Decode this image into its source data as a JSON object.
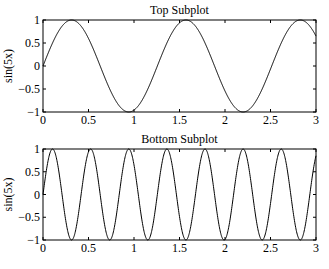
{
  "chart_data": [
    {
      "type": "line",
      "title": "Top Subplot",
      "xlabel": "",
      "ylabel": "sin(5x)",
      "function": "sin(5x)",
      "xlim": [
        0,
        3
      ],
      "ylim": [
        -1,
        1
      ],
      "xticks": [
        0,
        0.5,
        1,
        1.5,
        2,
        2.5,
        3
      ],
      "xtick_labels": [
        "0",
        "0.5",
        "1",
        "1.5",
        "2",
        "2.5",
        "3"
      ],
      "yticks": [
        -1,
        -0.5,
        0,
        0.5,
        1
      ],
      "ytick_labels": [
        "−1",
        "−0.5",
        "0",
        "0.5",
        "1"
      ],
      "grid": false,
      "frequency": 5
    },
    {
      "type": "line",
      "title": "Bottom Subplot",
      "xlabel": "",
      "ylabel": "sin(5x)",
      "function": "sin(15x)",
      "xlim": [
        0,
        3
      ],
      "ylim": [
        -1,
        1
      ],
      "xticks": [
        0,
        0.5,
        1,
        1.5,
        2,
        2.5,
        3
      ],
      "xtick_labels": [
        "0",
        "0.5",
        "1",
        "1.5",
        "2",
        "2.5",
        "3"
      ],
      "yticks": [
        -1,
        -0.5,
        0,
        0.5,
        1
      ],
      "ytick_labels": [
        "−1",
        "−0.5",
        "0",
        "0.5",
        "1"
      ],
      "grid": false,
      "frequency": 15
    }
  ],
  "layout": {
    "axes": [
      {
        "left": 43,
        "right": 316,
        "top": 20,
        "bottom": 112
      },
      {
        "left": 43,
        "right": 316,
        "top": 149,
        "bottom": 240
      }
    ]
  }
}
